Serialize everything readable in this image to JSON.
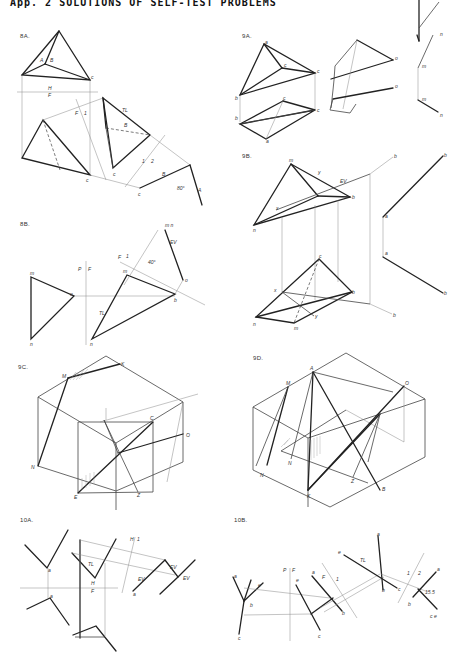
{
  "header": {
    "title": "App. 2  SOLUTIONS OF SELF-TEST PROBLEMS"
  },
  "figures": [
    {
      "id": "8A",
      "label": "8A.",
      "annotations": [
        "A",
        "B",
        "c^H",
        "H",
        "F",
        "F",
        "1",
        "TL",
        "B",
        "c^F",
        "c^1",
        "1",
        "2",
        "B",
        "80°",
        "c^2",
        "A"
      ]
    },
    {
      "id": "8B",
      "label": "8B.",
      "annotations": [
        "m^F",
        "o",
        "n",
        "P",
        "F",
        "F",
        "1",
        "m^F",
        "40°",
        "EV",
        "m^1 n",
        "o",
        "b",
        "TL",
        "n"
      ]
    },
    {
      "id": "9A",
      "label": "9A.",
      "annotations": [
        "a",
        "c^H",
        "c",
        "b",
        "b",
        "c^F",
        "c",
        "a",
        "o^H",
        "o^F",
        "n",
        "m^H",
        "m^F",
        "n"
      ]
    },
    {
      "id": "9B",
      "label": "9B.",
      "annotations": [
        "m",
        "y",
        "EV",
        "b1",
        "x",
        "b",
        "n",
        "x",
        "b",
        "y",
        "n",
        "m",
        "b1",
        "a^H",
        "a^F",
        "b",
        "b"
      ]
    },
    {
      "id": "9C",
      "label": "9C.",
      "annotations": [
        "M",
        "K",
        "N",
        "C",
        "O",
        "E",
        "Z"
      ]
    },
    {
      "id": "9D",
      "label": "9D.",
      "annotations": [
        "A",
        "M",
        "O",
        "N1",
        "N",
        "Z",
        "B",
        "K"
      ]
    },
    {
      "id": "10A",
      "label": "10A.",
      "annotations": [
        "a^H",
        "a^F",
        "H",
        "F",
        "TL",
        "H",
        "1",
        "EV",
        "a^1",
        "EV",
        "EV"
      ]
    },
    {
      "id": "10B",
      "label": "10B.",
      "annotations": [
        "a^H",
        "e",
        "b",
        "c^H",
        "P",
        "F",
        "e",
        "a^F",
        "c^F",
        "F",
        "1",
        "b",
        "TL",
        "e",
        "a^1",
        "b",
        "c^1",
        "1",
        "2",
        "a^2",
        "b",
        "15.5",
        "c^2 e"
      ]
    }
  ]
}
